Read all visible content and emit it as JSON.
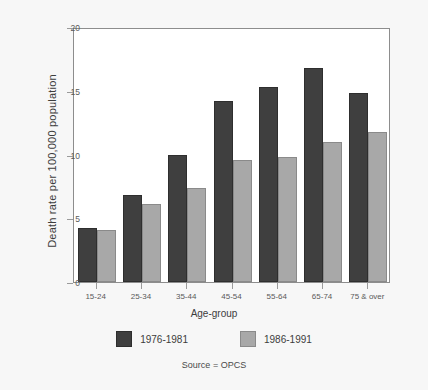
{
  "chart_data": {
    "type": "bar",
    "title": "",
    "xlabel": "Age-group",
    "ylabel": "Death rate per 100,000 population",
    "categories": [
      "15-24",
      "25-34",
      "35-44",
      "45-54",
      "55-64",
      "65-74",
      "75 & over"
    ],
    "series": [
      {
        "name": "1976-1981",
        "color": "#3f3f3f",
        "values": [
          4.2,
          6.8,
          10.0,
          14.2,
          15.3,
          16.8,
          14.8
        ]
      },
      {
        "name": "1986-1991",
        "color": "#a8a8a8",
        "values": [
          4.1,
          6.1,
          7.4,
          9.6,
          9.8,
          11.0,
          11.8
        ]
      }
    ],
    "ylim": [
      0,
      20
    ],
    "yticks": [
      0,
      5,
      10,
      15,
      20
    ],
    "ytick_labels": [
      "0",
      "5",
      "10",
      "15",
      "20"
    ],
    "grid": false,
    "legend_position": "bottom"
  },
  "annotations": {
    "source": "Source = OPCS"
  }
}
